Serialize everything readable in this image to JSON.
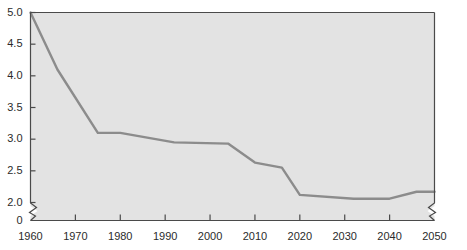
{
  "chart_data": {
    "type": "line",
    "title": "",
    "subtitle": "",
    "xlabel": "",
    "ylabel": "",
    "xlim": [
      1960,
      2050
    ],
    "ylim": [
      2.0,
      5.0
    ],
    "y_axis_break": true,
    "y_break_note": "axis broken between 2.0 and 0",
    "x_axis_break_right": true,
    "grid": false,
    "legend": false,
    "legend_entries": [],
    "annotations": [],
    "xticks": [
      1960,
      1970,
      1980,
      1990,
      2000,
      2010,
      2020,
      2030,
      2040,
      2050
    ],
    "xtick_labels": [
      "1960",
      "1970",
      "1980",
      "1990",
      "2000",
      "2010",
      "2020",
      "2030",
      "2040",
      "2050"
    ],
    "yticks": [
      5.0,
      4.5,
      4.0,
      3.5,
      3.0,
      2.5,
      2.0,
      0
    ],
    "ytick_labels": [
      "5.0",
      "4.5",
      "4.0",
      "3.5",
      "3.0",
      "2.5",
      "2.0",
      "0"
    ],
    "series": [
      {
        "name": "value",
        "color": "#8c8c8c",
        "x": [
          1960,
          1966,
          1975,
          1980,
          1992,
          2004,
          2010,
          2016,
          2020,
          2032,
          2040,
          2046,
          2050
        ],
        "values": [
          5.0,
          4.1,
          3.1,
          3.1,
          2.95,
          2.93,
          2.63,
          2.55,
          2.12,
          2.06,
          2.06,
          2.17,
          2.17
        ]
      }
    ]
  },
  "style": {
    "plot_background": "#e3e3e3",
    "line_color": "#8c8c8c",
    "axis_color": "#4a4a4a",
    "tick_label_color": "#2b2b2b",
    "page_background": "#ffffff"
  }
}
